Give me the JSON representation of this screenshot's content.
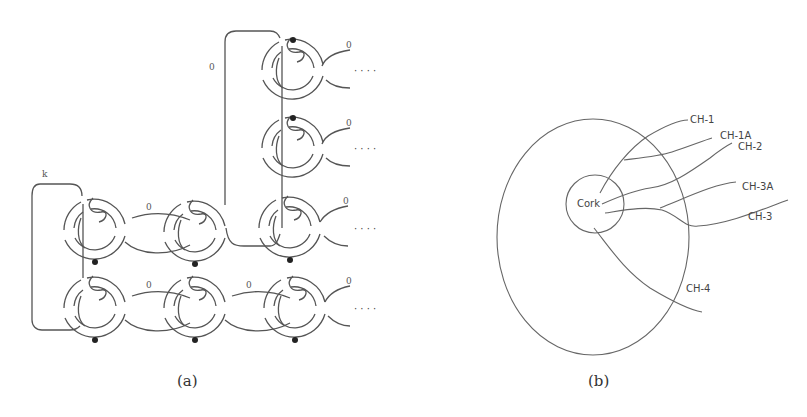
{
  "figure": {
    "panel_a": {
      "caption": "(a)",
      "framing_labels": {
        "k": "k",
        "zero": "0"
      },
      "ellipsis": "· · · ·",
      "description": "Kirby diagram: grid of dotted-circle/0-framed handle components with linking, k-framed curve on left"
    },
    "panel_b": {
      "caption": "(b)",
      "center_label": "Cork",
      "channels": [
        "CH-1",
        "CH-1A",
        "CH-2",
        "CH-3A",
        "CH-3",
        "CH-4"
      ]
    }
  }
}
